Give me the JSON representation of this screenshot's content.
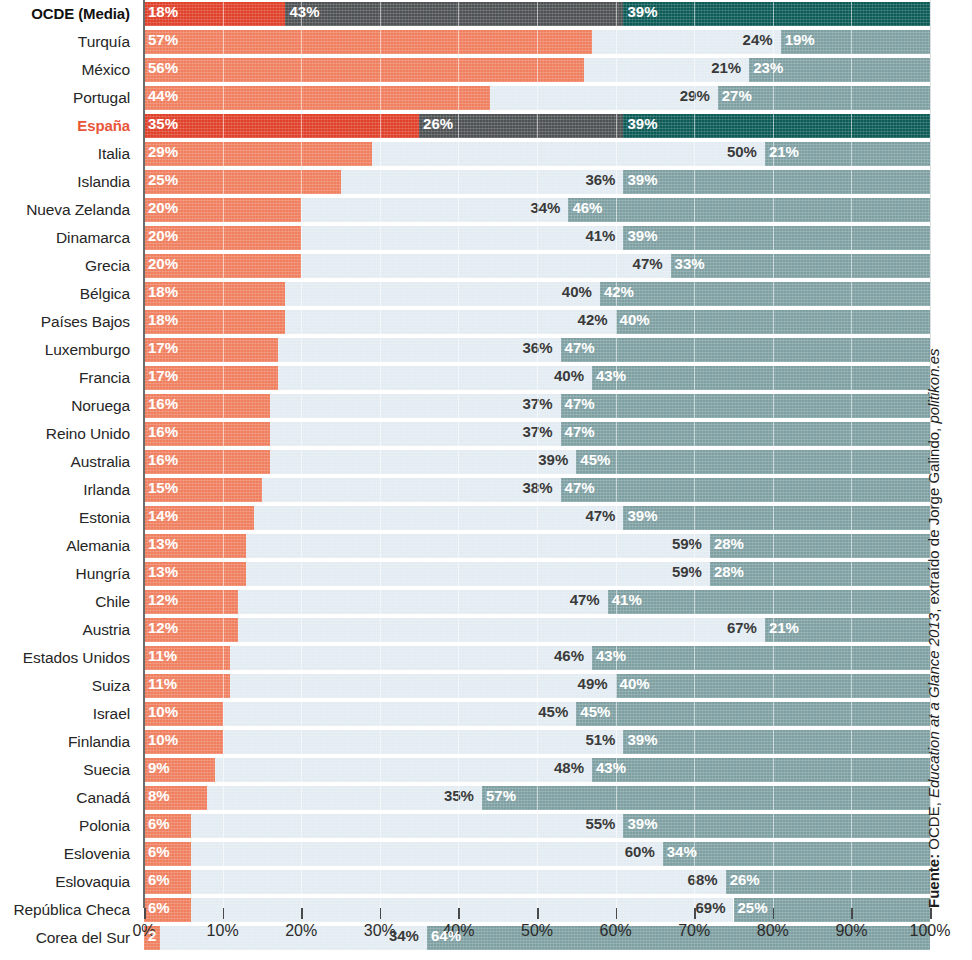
{
  "chart_data": {
    "type": "bar",
    "subtype": "stacked-horizontal-100",
    "title": "",
    "xlabel": "",
    "ylabel": "",
    "xlim": [
      0,
      100
    ],
    "xticks": [
      "0%",
      "10%",
      "20%",
      "30%",
      "40%",
      "50%",
      "60%",
      "70%",
      "80%",
      "90%",
      "100%"
    ],
    "grid": true,
    "legend": "none",
    "unit": "%",
    "series": [
      {
        "name": "segment-1",
        "color": "#ef7f5f",
        "highlight_color": "#e0412a"
      },
      {
        "name": "segment-2",
        "color": "#e3ecf2",
        "highlight_color": "#4f5254"
      },
      {
        "name": "segment-3",
        "color": "#7fa0a3",
        "highlight_color": "#0d5b57"
      }
    ],
    "categories": [
      "OCDE (Media)",
      "Turquía",
      "México",
      "Portugal",
      "España",
      "Italia",
      "Islandia",
      "Nueva Zelanda",
      "Dinamarca",
      "Grecia",
      "Bélgica",
      "Países Bajos",
      "Luxemburgo",
      "Francia",
      "Noruega",
      "Reino Unido",
      "Australia",
      "Irlanda",
      "Estonia",
      "Alemania",
      "Hungría",
      "Chile",
      "Austria",
      "Estados Unidos",
      "Suiza",
      "Israel",
      "Finlandia",
      "Suecia",
      "Canadá",
      "Polonia",
      "Eslovenia",
      "Eslovaquia",
      "República Checa",
      "Corea del Sur"
    ],
    "rows": [
      {
        "label": "OCDE (Media)",
        "values": [
          18,
          43,
          39
        ],
        "labels": [
          "18%",
          "43%",
          "39%"
        ],
        "highlight": "dark"
      },
      {
        "label": "Turquía",
        "values": [
          57,
          24,
          19
        ],
        "labels": [
          "57%",
          "24%",
          "19%"
        ],
        "highlight": "none"
      },
      {
        "label": "México",
        "values": [
          56,
          21,
          23
        ],
        "labels": [
          "56%",
          "21%",
          "23%"
        ],
        "highlight": "none"
      },
      {
        "label": "Portugal",
        "values": [
          44,
          29,
          27
        ],
        "labels": [
          "44%",
          "29%",
          "27%"
        ],
        "highlight": "none"
      },
      {
        "label": "España",
        "values": [
          35,
          26,
          39
        ],
        "labels": [
          "35%",
          "26%",
          "39%"
        ],
        "highlight": "accent"
      },
      {
        "label": "Italia",
        "values": [
          29,
          50,
          21
        ],
        "labels": [
          "29%",
          "50%",
          "21%"
        ],
        "highlight": "none"
      },
      {
        "label": "Islandia",
        "values": [
          25,
          36,
          39
        ],
        "labels": [
          "25%",
          "36%",
          "39%"
        ],
        "highlight": "none"
      },
      {
        "label": "Nueva Zelanda",
        "values": [
          20,
          34,
          46
        ],
        "labels": [
          "20%",
          "34%",
          "46%"
        ],
        "highlight": "none"
      },
      {
        "label": "Dinamarca",
        "values": [
          20,
          41,
          39
        ],
        "labels": [
          "20%",
          "41%",
          "39%"
        ],
        "highlight": "none"
      },
      {
        "label": "Grecia",
        "values": [
          20,
          47,
          33
        ],
        "labels": [
          "20%",
          "47%",
          "33%"
        ],
        "highlight": "none"
      },
      {
        "label": "Bélgica",
        "values": [
          18,
          40,
          42
        ],
        "labels": [
          "18%",
          "40%",
          "42%"
        ],
        "highlight": "none"
      },
      {
        "label": "Países Bajos",
        "values": [
          18,
          42,
          40
        ],
        "labels": [
          "18%",
          "42%",
          "40%"
        ],
        "highlight": "none"
      },
      {
        "label": "Luxemburgo",
        "values": [
          17,
          36,
          47
        ],
        "labels": [
          "17%",
          "36%",
          "47%"
        ],
        "highlight": "none"
      },
      {
        "label": "Francia",
        "values": [
          17,
          40,
          43
        ],
        "labels": [
          "17%",
          "40%",
          "43%"
        ],
        "highlight": "none"
      },
      {
        "label": "Noruega",
        "values": [
          16,
          37,
          47
        ],
        "labels": [
          "16%",
          "37%",
          "47%"
        ],
        "highlight": "none"
      },
      {
        "label": "Reino Unido",
        "values": [
          16,
          37,
          47
        ],
        "labels": [
          "16%",
          "37%",
          "47%"
        ],
        "highlight": "none"
      },
      {
        "label": "Australia",
        "values": [
          16,
          39,
          45
        ],
        "labels": [
          "16%",
          "39%",
          "45%"
        ],
        "highlight": "none"
      },
      {
        "label": "Irlanda",
        "values": [
          15,
          38,
          47
        ],
        "labels": [
          "15%",
          "38%",
          "47%"
        ],
        "highlight": "none"
      },
      {
        "label": "Estonia",
        "values": [
          14,
          47,
          39
        ],
        "labels": [
          "14%",
          "47%",
          "39%"
        ],
        "highlight": "none"
      },
      {
        "label": "Alemania",
        "values": [
          13,
          59,
          28
        ],
        "labels": [
          "13%",
          "59%",
          "28%"
        ],
        "highlight": "none"
      },
      {
        "label": "Hungría",
        "values": [
          13,
          59,
          28
        ],
        "labels": [
          "13%",
          "59%",
          "28%"
        ],
        "highlight": "none"
      },
      {
        "label": "Chile",
        "values": [
          12,
          47,
          41
        ],
        "labels": [
          "12%",
          "47%",
          "41%"
        ],
        "highlight": "none"
      },
      {
        "label": "Austria",
        "values": [
          12,
          67,
          21
        ],
        "labels": [
          "12%",
          "67%",
          "21%"
        ],
        "highlight": "none"
      },
      {
        "label": "Estados Unidos",
        "values": [
          11,
          46,
          43
        ],
        "labels": [
          "11%",
          "46%",
          "43%"
        ],
        "highlight": "none"
      },
      {
        "label": "Suiza",
        "values": [
          11,
          49,
          40
        ],
        "labels": [
          "11%",
          "49%",
          "40%"
        ],
        "highlight": "none"
      },
      {
        "label": "Israel",
        "values": [
          10,
          45,
          45
        ],
        "labels": [
          "10%",
          "45%",
          "45%"
        ],
        "highlight": "none"
      },
      {
        "label": "Finlandia",
        "values": [
          10,
          51,
          39
        ],
        "labels": [
          "10%",
          "51%",
          "39%"
        ],
        "highlight": "none"
      },
      {
        "label": "Suecia",
        "values": [
          9,
          48,
          43
        ],
        "labels": [
          "9%",
          "48%",
          "43%"
        ],
        "highlight": "none"
      },
      {
        "label": "Canadá",
        "values": [
          8,
          35,
          57
        ],
        "labels": [
          "8%",
          "35%",
          "57%"
        ],
        "highlight": "none"
      },
      {
        "label": "Polonia",
        "values": [
          6,
          55,
          39
        ],
        "labels": [
          "6%",
          "55%",
          "39%"
        ],
        "highlight": "none"
      },
      {
        "label": "Eslovenia",
        "values": [
          6,
          60,
          34
        ],
        "labels": [
          "6%",
          "60%",
          "34%"
        ],
        "highlight": "none"
      },
      {
        "label": "Eslovaquia",
        "values": [
          6,
          68,
          26
        ],
        "labels": [
          "6%",
          "68%",
          "26%"
        ],
        "highlight": "none"
      },
      {
        "label": "República Checa",
        "values": [
          6,
          69,
          25
        ],
        "labels": [
          "6%",
          "69%",
          "25%"
        ],
        "highlight": "none"
      },
      {
        "label": "Corea del Sur",
        "values": [
          2,
          34,
          64
        ],
        "labels": [
          "2",
          "34%",
          "64%"
        ],
        "highlight": "none"
      }
    ]
  },
  "source": {
    "prefix": "Fuente:",
    "org": " OCDE, ",
    "work": "Education at a Glance 2013",
    "middle": ", extraído de Jorge Galindo, ",
    "site": "politikon.es"
  },
  "colors": {
    "accent": "#e8563a",
    "segment1": "#ef7f5f",
    "segment2": "#e3ecf2",
    "segment3": "#7fa0a3",
    "segment1_highlight": "#e0412a",
    "segment2_highlight": "#4f5254",
    "segment3_highlight": "#0d5b57",
    "text": "#262626"
  }
}
